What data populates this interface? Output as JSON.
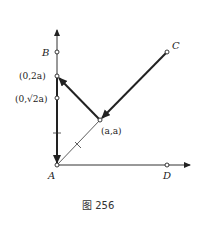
{
  "figure": {
    "caption": "图 256",
    "points": {
      "A": {
        "label": "A"
      },
      "B": {
        "label": "B"
      },
      "C": {
        "label": "C"
      },
      "D": {
        "label": "D"
      },
      "P2a": {
        "label": "(0,2a)"
      },
      "Psqrt2a": {
        "label": "(0,√2a)"
      },
      "Paa": {
        "label": "(a,a)"
      }
    },
    "colors": {
      "line": "#222222",
      "axis": "#333333",
      "background": "#ffffff"
    }
  }
}
